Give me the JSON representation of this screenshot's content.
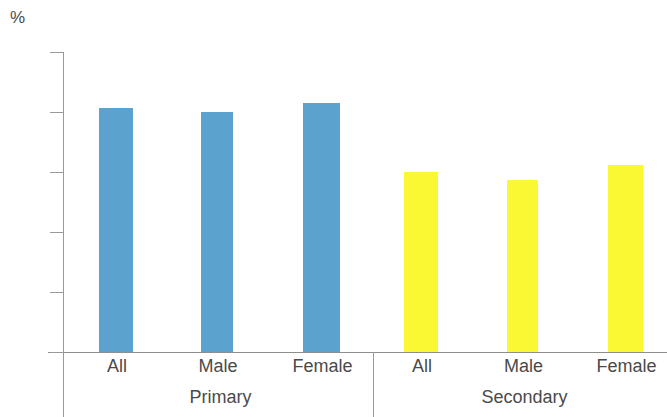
{
  "chart_data": {
    "type": "bar",
    "title": "",
    "xlabel": "",
    "ylabel": "%",
    "unit_label": "%",
    "ylim": [
      0,
      100
    ],
    "yticks": [
      0,
      20,
      40,
      60,
      80,
      100
    ],
    "ytick_labels": [
      "0",
      "20",
      "40",
      "60",
      "80",
      "100"
    ],
    "grid": false,
    "legend": "none",
    "categories": [
      "All",
      "Male",
      "Female",
      "All",
      "Male",
      "Female"
    ],
    "groups": [
      {
        "name": "Primary",
        "categories": [
          "All",
          "Male",
          "Female"
        ],
        "values": [
          81.5,
          80,
          83
        ],
        "color": "#5BA3CE"
      },
      {
        "name": "Secondary",
        "categories": [
          "All",
          "Male",
          "Female"
        ],
        "values": [
          60,
          57.5,
          62.5
        ],
        "color": "#FAF832"
      }
    ],
    "values": [
      81.5,
      80,
      83,
      60,
      57.5,
      62.5
    ],
    "colors": {
      "primary_bar": "#5BA3CE",
      "secondary_bar": "#FAF832",
      "axis": "#9a9a9a",
      "text": "#4a4a4a",
      "background": "#ffffff"
    },
    "bars": [
      {
        "label": "All",
        "group": "Primary",
        "value": 81.5,
        "color": "#5BA3CE",
        "x": 99,
        "width": 34
      },
      {
        "label": "Male",
        "group": "Primary",
        "value": 80,
        "color": "#5BA3CE",
        "x": 201,
        "width": 32
      },
      {
        "label": "Female",
        "group": "Primary",
        "value": 83,
        "color": "#5BA3CE",
        "x": 303,
        "width": 37
      },
      {
        "label": "All",
        "group": "Secondary",
        "value": 60,
        "color": "#FAF832",
        "x": 404,
        "width": 34
      },
      {
        "label": "Male",
        "group": "Secondary",
        "value": 57.5,
        "color": "#FAF832",
        "x": 507,
        "width": 31
      },
      {
        "label": "Female",
        "group": "Secondary",
        "value": 62.5,
        "color": "#FAF832",
        "x": 608,
        "width": 35
      }
    ]
  },
  "axis": {
    "unit": "%",
    "ticks": [
      "100",
      "80",
      "60",
      "40",
      "20",
      "0"
    ]
  },
  "labels": {
    "categories": [
      "All",
      "Male",
      "Female",
      "All",
      "Male",
      "Female"
    ],
    "groups": [
      "Primary",
      "Secondary"
    ]
  }
}
